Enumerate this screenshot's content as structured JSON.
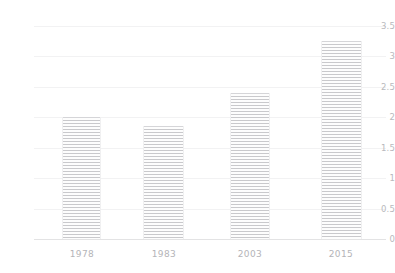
{
  "chart_data": {
    "type": "bar",
    "title": "",
    "subtitle": "",
    "xlabel": "",
    "ylabel": "",
    "categories": [
      "1978",
      "1983",
      "2003",
      "2015"
    ],
    "values": [
      2.0,
      1.85,
      2.4,
      3.25
    ],
    "series": [
      {
        "name": "",
        "values": [
          2.0,
          1.85,
          2.4,
          3.25
        ]
      }
    ],
    "ylim": [
      0,
      3.5
    ],
    "yticks": [
      0,
      0.5,
      1,
      1.5,
      2,
      2.5,
      3,
      3.5
    ],
    "ytick_labels": [
      "0",
      "0.5",
      "1",
      "1.5",
      "2",
      "2.5",
      "3",
      "3.5"
    ],
    "xtick_labels": [
      "1978",
      "1983",
      "2003",
      "2015"
    ],
    "grid": true,
    "grid_axis": "y",
    "legend": false,
    "legend_position": "none",
    "annotations": [],
    "bar_fill": "horizontal-hatch",
    "colors": {
      "bar_fill": "#c9c9cc",
      "bar_background": "#fdfdfd",
      "bar_edge": "#f0f0f1",
      "gridline": "#f2f2f3",
      "axis": "#e3e3e4",
      "tick_text": "#b9b9bd",
      "background": "#ffffff"
    }
  },
  "axes": {
    "y": {
      "ticks": [
        {
          "label": "3.5",
          "value": 3.5
        },
        {
          "label": "3",
          "value": 3.0
        },
        {
          "label": "2.5",
          "value": 2.5
        },
        {
          "label": "2",
          "value": 2.0
        },
        {
          "label": "1.5",
          "value": 1.5
        },
        {
          "label": "1",
          "value": 1.0
        },
        {
          "label": "0.5",
          "value": 0.5
        },
        {
          "label": "0",
          "value": 0.0
        }
      ]
    },
    "x": {
      "ticks": [
        {
          "label": "1978"
        },
        {
          "label": "1983"
        },
        {
          "label": "2003"
        },
        {
          "label": "2015"
        }
      ]
    }
  }
}
